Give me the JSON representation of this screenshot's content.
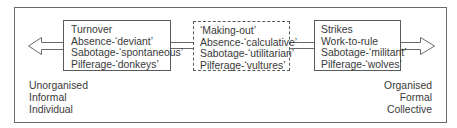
{
  "diagram": {
    "type": "continuum",
    "left_box": {
      "lines": [
        "Turnover",
        "Absence-‘deviant’",
        "Sabotage-‘spontaneous’",
        "Pilferage-‘donkeys’"
      ]
    },
    "middle_box": {
      "style": "dashed",
      "lines": [
        "‘Making-out’",
        "Absence-‘calculative’",
        "Sabotage-‘utilitarian’",
        "Pilferage-‘vultures’"
      ]
    },
    "right_box": {
      "lines": [
        "Strikes",
        "Work-to-rule",
        "Sabotage-‘militant’",
        "Pilferage-‘wolves’"
      ]
    },
    "left_pole": {
      "arrow": "arrow-left",
      "labels": [
        "Unorganised",
        "Informal",
        "Individual"
      ]
    },
    "right_pole": {
      "arrow": "arrow-right",
      "labels": [
        "Organised",
        "Formal",
        "Collective"
      ]
    },
    "colors": {
      "stroke": "#5a5a5a",
      "text": "#3a3a3a",
      "background": "#ffffff"
    }
  }
}
